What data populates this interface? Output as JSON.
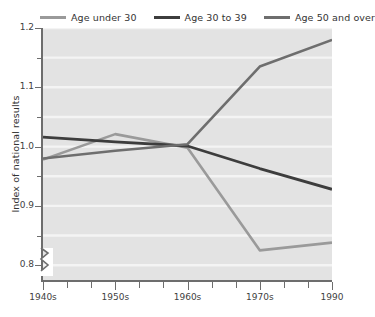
{
  "chart_data": {
    "type": "line",
    "title": "",
    "subtitle": "",
    "xlabel": "",
    "ylabel": "Index of national results",
    "x": [
      "1940s",
      "1950s",
      "1960s",
      "1970s",
      "1990"
    ],
    "x_tick_labels": [
      "1940s",
      "1950s",
      "1960s",
      "1970s",
      "1990"
    ],
    "y_tick_labels": [
      "1.2",
      "1.1",
      "1.0",
      "0.9",
      "0.8"
    ],
    "y_major_ticks": [
      1.2,
      1.1,
      1.0,
      0.9,
      0.8
    ],
    "y_minor_ticks": [
      1.15,
      1.05,
      0.95,
      0.85
    ],
    "ylim": [
      0.775,
      1.2
    ],
    "xlim": [
      0,
      4
    ],
    "grid": "horizontal-white-gridlines",
    "axis_break": "y-axis-break-below-0.8",
    "legend_position": "top",
    "series": [
      {
        "name": "Age under 30",
        "color": "#9a9a9a",
        "values": [
          0.978,
          1.021,
          0.998,
          0.825,
          0.838
        ]
      },
      {
        "name": "Age 30 to 39",
        "color": "#3d3d3d",
        "values": [
          1.016,
          1.008,
          1.001,
          0.963,
          0.928
        ]
      },
      {
        "name": "Age 50 and over",
        "color": "#6e6e6e",
        "values": [
          0.98,
          0.993,
          1.004,
          1.135,
          1.18
        ]
      }
    ]
  },
  "legend": {
    "entries": [
      {
        "label": "Age under 30",
        "color": "#9a9a9a"
      },
      {
        "label": "Age 30 to 39",
        "color": "#3d3d3d"
      },
      {
        "label": "Age 50 and over",
        "color": "#6e6e6e"
      }
    ]
  },
  "axes": {
    "y_title": "Index of national results",
    "y_labels": [
      "1.2",
      "1.1",
      "1.0",
      "0.9",
      "0.8"
    ],
    "x_labels": [
      "1940s",
      "1950s",
      "1960s",
      "1970s",
      "1990"
    ]
  },
  "colors": {
    "plot_background": "#e3e3e3",
    "gridline": "#f4f4f4",
    "axis": "#6d6d6d",
    "text": "#3a3a3a"
  }
}
